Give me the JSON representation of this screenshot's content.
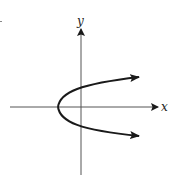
{
  "diagram": {
    "type": "parabola-on-axes",
    "axes": {
      "x_label": "x",
      "y_label": "y"
    },
    "colors": {
      "stroke": "#1a1a1a",
      "axis": "#555555",
      "background": "#ffffff"
    }
  }
}
